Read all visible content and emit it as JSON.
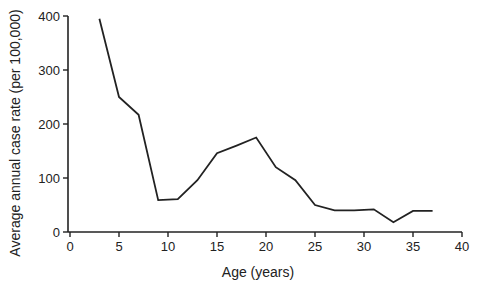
{
  "chart_data": {
    "type": "line",
    "title": "",
    "xlabel": "Age (years)",
    "ylabel": "Average annual case rate (per 100,000)",
    "xlim": [
      0,
      40
    ],
    "ylim": [
      0,
      400
    ],
    "xticks": [
      0,
      5,
      10,
      15,
      20,
      25,
      30,
      35,
      40
    ],
    "yticks": [
      0,
      100,
      200,
      300,
      400
    ],
    "grid": false,
    "legend": null,
    "series": [
      {
        "name": "Case rate",
        "color": "#222222",
        "x": [
          3,
          5,
          7,
          9,
          11,
          13,
          15,
          17,
          19,
          21,
          23,
          25,
          27,
          29,
          31,
          33,
          35,
          37
        ],
        "values": [
          395,
          250,
          217,
          59,
          61,
          96,
          146,
          160,
          175,
          120,
          96,
          50,
          40,
          40,
          42,
          18,
          39,
          39
        ]
      }
    ]
  },
  "layout": {
    "plot": {
      "x0": 70,
      "x1": 462,
      "y0": 232,
      "y1": 16
    }
  }
}
